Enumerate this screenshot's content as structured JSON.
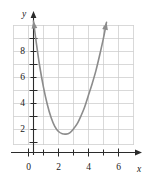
{
  "chart_data": {
    "type": "line",
    "title": "",
    "subtitle": "",
    "xlabel": "x",
    "ylabel": "y",
    "xlim": [
      -1,
      7
    ],
    "ylim": [
      0,
      10
    ],
    "grid": true,
    "grid_step_x": 1,
    "grid_step_y": 1,
    "legend": "none",
    "x_ticks": [
      0,
      1,
      2,
      3,
      4,
      5,
      6,
      7
    ],
    "x_tick_labels": [
      "0",
      "",
      "2",
      "",
      "4",
      "",
      "6",
      ""
    ],
    "y_ticks": [
      1,
      2,
      3,
      4,
      5,
      6,
      7,
      8,
      9
    ],
    "y_tick_labels": [
      "",
      "2",
      "",
      "4",
      "",
      "6",
      "",
      "8",
      ""
    ],
    "labeled_x_ticks": [
      "0",
      "2",
      "4",
      "6"
    ],
    "labeled_y_ticks": [
      "2",
      "4",
      "6",
      "8"
    ],
    "series": [
      {
        "name": "parabola",
        "kind": "curve",
        "color": "#8c8c8c",
        "arrow_start": true,
        "arrow_end": true,
        "vertex": [
          2.5,
          0.8
        ],
        "y_intercept": 8.0,
        "points": [
          [
            0.33,
            9.5
          ],
          [
            0.5,
            8.0
          ],
          [
            0.75,
            6.0
          ],
          [
            1.0,
            4.4
          ],
          [
            1.25,
            3.1
          ],
          [
            1.5,
            2.1
          ],
          [
            1.75,
            1.4
          ],
          [
            2.0,
            1.0
          ],
          [
            2.25,
            0.83
          ],
          [
            2.5,
            0.8
          ],
          [
            2.75,
            0.9
          ],
          [
            3.0,
            1.2
          ],
          [
            3.25,
            1.6
          ],
          [
            3.5,
            2.2
          ],
          [
            3.75,
            2.9
          ],
          [
            4.0,
            3.8
          ],
          [
            4.25,
            4.7
          ],
          [
            4.5,
            5.7
          ],
          [
            4.75,
            6.9
          ],
          [
            5.0,
            8.2
          ],
          [
            5.2,
            9.4
          ]
        ]
      }
    ]
  },
  "axes": {
    "x_axis_name": "x",
    "y_axis_name": "y",
    "x_arrow": true,
    "y_arrow": true
  },
  "colors": {
    "curve": "#8c8c8c",
    "grid": "#c9c9c9",
    "axis": "#2b2b2b",
    "text": "#1a1a1a",
    "background": "#ffffff"
  }
}
